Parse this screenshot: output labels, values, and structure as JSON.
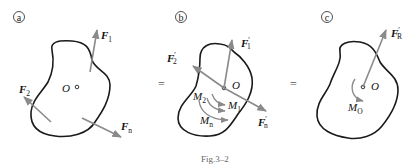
{
  "figure": {
    "caption": "Fig.3–2",
    "equals_sign": "=",
    "panels": [
      {
        "id": "a",
        "marker": "a",
        "point_label": "O",
        "forces": [
          {
            "name": "F",
            "subscript": "1",
            "prime": false
          },
          {
            "name": "F",
            "subscript": "2",
            "prime": false
          },
          {
            "name": "F",
            "subscript": "n",
            "prime": false
          }
        ]
      },
      {
        "id": "b",
        "marker": "b",
        "point_label": "O",
        "forces": [
          {
            "name": "F",
            "subscript": "1",
            "prime": true
          },
          {
            "name": "F",
            "subscript": "2",
            "prime": true
          },
          {
            "name": "F",
            "subscript": "n",
            "prime": true
          }
        ],
        "moments": [
          {
            "name": "M",
            "subscript": "1"
          },
          {
            "name": "M",
            "subscript": "2"
          },
          {
            "name": "M",
            "subscript": "n"
          }
        ]
      },
      {
        "id": "c",
        "marker": "c",
        "point_label": "O",
        "forces": [
          {
            "name": "F",
            "subscript": "R",
            "prime": true
          }
        ],
        "moments": [
          {
            "name": "M",
            "subscript": "O"
          }
        ]
      }
    ]
  }
}
